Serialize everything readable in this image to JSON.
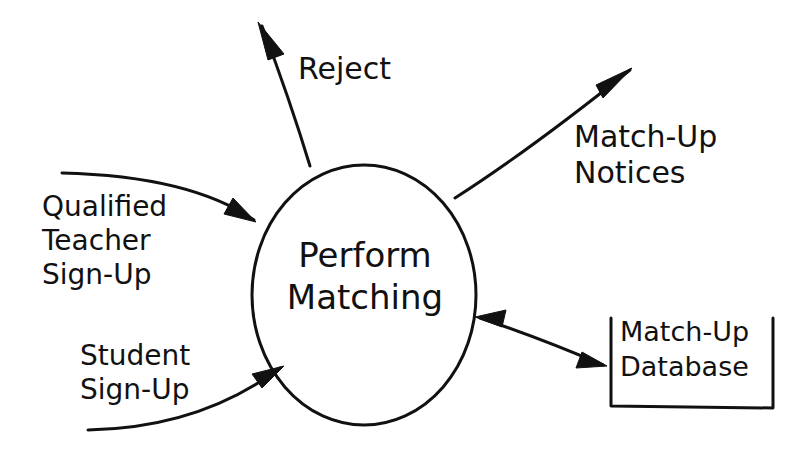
{
  "diagram": {
    "type": "data-flow-diagram",
    "process": {
      "label_line1": "Perform",
      "label_line2": "Matching"
    },
    "data_store": {
      "label_line1": "Match-Up",
      "label_line2": "Database"
    },
    "flows": [
      {
        "id": "reject",
        "label_line1": "Reject",
        "direction": "out"
      },
      {
        "id": "match-up-notices",
        "label_line1": "Match-Up",
        "label_line2": "Notices",
        "direction": "out"
      },
      {
        "id": "qualified-teacher-sign-up",
        "label_line1": "Qualified",
        "label_line2": "Teacher",
        "label_line3": "Sign-Up",
        "direction": "in"
      },
      {
        "id": "student-sign-up",
        "label_line1": "Student",
        "label_line2": "Sign-Up",
        "direction": "in"
      },
      {
        "id": "database-link",
        "direction": "bidirectional"
      }
    ],
    "colors": {
      "ink": "#111111",
      "background": "#ffffff"
    }
  }
}
